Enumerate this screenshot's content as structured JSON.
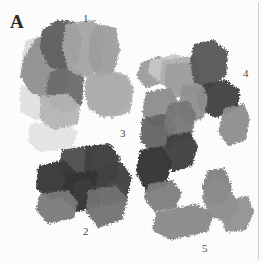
{
  "figure": {
    "panel_letter": "A",
    "background_color": "#ffffff",
    "rule_color": "#cfcfcf",
    "label_color": "#4a4a4a",
    "width": 263,
    "height": 263,
    "modality": "grayscale-patch-montage"
  },
  "labels": [
    {
      "id": "panel-a",
      "text": "A",
      "x": 10,
      "y": 12
    },
    {
      "id": "num-1",
      "text": "1",
      "x": 83,
      "y": 13
    },
    {
      "id": "num-4",
      "text": "4",
      "x": 243,
      "y": 68
    },
    {
      "id": "num-3",
      "text": "3",
      "x": 120,
      "y": 128
    },
    {
      "id": "num-2",
      "text": "2",
      "x": 83,
      "y": 226
    },
    {
      "id": "num-5",
      "text": "5",
      "x": 202,
      "y": 243
    }
  ],
  "clusters": [
    {
      "id": "cluster-1",
      "label": "1",
      "description": "upper-left group of mid-to-dark grey patches with pale halo",
      "patch_count": 9
    },
    {
      "id": "cluster-4",
      "label": "4",
      "description": "upper-right group of light and very dark grey patches",
      "patch_count": 7
    },
    {
      "id": "cluster-3",
      "label": "3",
      "description": "central column of medium and dark grey patches",
      "patch_count": 6
    },
    {
      "id": "cluster-2",
      "label": "2",
      "description": "lower-left group of dark charcoal patches with mid-grey lobes",
      "patch_count": 7
    },
    {
      "id": "cluster-5",
      "label": "5",
      "description": "lower-right group of mid-grey angular patches",
      "patch_count": 4
    }
  ],
  "patches": [
    {
      "cluster": "1",
      "fill": "#d8d8d8",
      "opacity": 0.85,
      "points": "22,60 26,40 46,36 56,48 54,74 34,84 20,76"
    },
    {
      "cluster": "1",
      "fill": "#dedede",
      "opacity": 0.85,
      "points": "20,86 42,82 58,92 56,112 36,120 20,112"
    },
    {
      "cluster": "1",
      "fill": "#e2e2e2",
      "opacity": 0.85,
      "points": "30,124 64,120 78,132 72,148 40,152 28,142"
    },
    {
      "cluster": "1",
      "fill": "#8e8e8e",
      "opacity": 0.95,
      "points": "24,58 36,38 54,32 66,42 72,64 66,90 48,100 30,92 20,76"
    },
    {
      "cluster": "1",
      "fill": "#5d5d5d",
      "opacity": 0.97,
      "points": "42,30 58,20 76,22 82,38 78,62 64,72 48,66 40,48"
    },
    {
      "cluster": "1",
      "fill": "#6a6a6a",
      "opacity": 0.96,
      "points": "50,72 72,66 84,76 82,104 64,114 50,106 46,88"
    },
    {
      "cluster": "1",
      "fill": "#a3a3a3",
      "opacity": 0.95,
      "points": "66,24 94,20 104,32 102,68 84,78 68,70 62,46"
    },
    {
      "cluster": "1",
      "fill": "#9c9c9c",
      "opacity": 0.95,
      "points": "98,24 116,28 120,50 114,72 98,78 88,60 90,34"
    },
    {
      "cluster": "1",
      "fill": "#a8a8a8",
      "opacity": 0.95,
      "points": "88,74 120,72 130,84 126,110 104,118 88,108 84,88"
    },
    {
      "cluster": "1",
      "fill": "#b4b4b4",
      "opacity": 0.95,
      "points": "40,96 68,94 80,106 78,124 54,130 40,120"
    },
    {
      "cluster": "1",
      "fill": "#adadad",
      "opacity": 0.95,
      "points": "106,76 126,74 134,88 130,112 112,118 102,104"
    },
    {
      "cluster": "1",
      "fill": "#9a9a9a",
      "opacity": 0.95,
      "points": "142,62 160,56 172,66 166,82 146,88 136,76"
    },
    {
      "cluster": "4",
      "fill": "#c9c9c9",
      "opacity": 0.92,
      "points": "150,60 176,54 190,60 186,76 160,82 148,72"
    },
    {
      "cluster": "4",
      "fill": "#b0b0b0",
      "opacity": 0.95,
      "points": "162,60 192,56 200,70 196,88 172,94 160,82"
    },
    {
      "cluster": "4",
      "fill": "#9d9d9d",
      "opacity": 0.95,
      "points": "166,64 194,62 202,78 196,94 174,98 164,84"
    },
    {
      "cluster": "4",
      "fill": "#545454",
      "opacity": 0.97,
      "points": "194,44 214,40 228,52 226,76 208,90 194,82 190,62"
    },
    {
      "cluster": "4",
      "fill": "#3e3e3e",
      "opacity": 0.97,
      "points": "202,84 226,80 240,90 238,108 216,118 200,110 196,96"
    },
    {
      "cluster": "4",
      "fill": "#8d8d8d",
      "opacity": 0.95,
      "points": "182,86 202,84 208,98 204,118 186,124 178,110"
    },
    {
      "cluster": "4",
      "fill": "#8b8b8b",
      "opacity": 0.95,
      "points": "224,108 244,104 250,118 246,140 228,146 218,132"
    },
    {
      "cluster": "3",
      "fill": "#8a8a8a",
      "opacity": 0.95,
      "points": "146,92 170,88 178,102 174,122 154,128 142,114"
    },
    {
      "cluster": "3",
      "fill": "#606060",
      "opacity": 0.96,
      "points": "142,118 166,114 176,126 172,148 152,154 140,140"
    },
    {
      "cluster": "3",
      "fill": "#747474",
      "opacity": 0.95,
      "points": "168,104 188,100 196,114 192,136 172,142 164,124"
    },
    {
      "cluster": "3",
      "fill": "#3b3b3b",
      "opacity": 0.97,
      "points": "168,136 190,132 198,146 192,166 172,172 162,156"
    },
    {
      "cluster": "3",
      "fill": "#2f2f2f",
      "opacity": 0.97,
      "points": "140,150 162,146 172,162 166,186 146,192 136,172"
    },
    {
      "cluster": "3",
      "fill": "#7a7a7a",
      "opacity": 0.95,
      "points": "148,184 172,180 182,192 176,208 154,212 144,198"
    },
    {
      "cluster": "2",
      "fill": "#4a4a4a",
      "opacity": 0.97,
      "points": "62,150 84,146 94,158 90,178 70,184 58,170"
    },
    {
      "cluster": "2",
      "fill": "#3a3a3a",
      "opacity": 0.97,
      "points": "86,146 110,144 120,158 116,180 96,188 84,172"
    },
    {
      "cluster": "2",
      "fill": "#343434",
      "opacity": 0.97,
      "points": "38,166 64,160 76,172 72,194 50,200 36,188"
    },
    {
      "cluster": "2",
      "fill": "#2e2e2e",
      "opacity": 0.97,
      "points": "66,174 96,170 106,184 100,206 76,212 62,196"
    },
    {
      "cluster": "2",
      "fill": "#3c3c3c",
      "opacity": 0.97,
      "points": "100,166 122,162 132,178 126,200 104,206 94,188"
    },
    {
      "cluster": "2",
      "fill": "#777777",
      "opacity": 0.95,
      "points": "40,194 68,190 78,202 74,218 48,224 36,210"
    },
    {
      "cluster": "2",
      "fill": "#6f6f6f",
      "opacity": 0.95,
      "points": "88,190 116,186 128,198 122,220 98,228 86,212"
    },
    {
      "cluster": "5",
      "fill": "#7d7d7d",
      "opacity": 0.95,
      "points": "208,170 224,168 232,186 226,202 210,206 202,188"
    },
    {
      "cluster": "5",
      "fill": "#8a8a8a",
      "opacity": 0.95,
      "points": "214,172 230,186 240,210 228,222 208,216 202,196"
    },
    {
      "cluster": "5",
      "fill": "#8f8f8f",
      "opacity": 0.95,
      "points": "226,200 248,196 254,212 246,230 226,232 220,216"
    },
    {
      "cluster": "5",
      "fill": "#878787",
      "opacity": 0.95,
      "points": "156,212 196,204 214,214 208,232 170,240 152,230"
    }
  ]
}
